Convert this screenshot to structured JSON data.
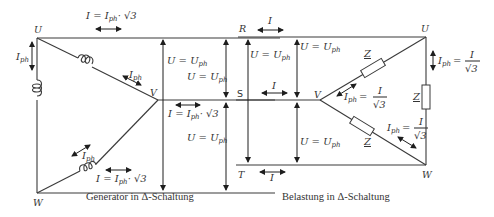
{
  "generator": {
    "caption": "Generator in Δ-Schaltung",
    "nodes": {
      "U": "U",
      "V": "V",
      "W": "W"
    },
    "line_current_top": "I = I",
    "line_current_bottom": "I = I",
    "mid_current": "I = I",
    "ph_sub": "ph",
    "sqrt3": "· √3",
    "phase_current": "I",
    "voltage_upper": "U = U",
    "voltage_upper2": "U = U",
    "voltage_lower": "U = U"
  },
  "load": {
    "caption": "Belastung in Δ-Schaltung",
    "lines": {
      "R": "R",
      "S": "S",
      "T": "T"
    },
    "nodes": {
      "U": "U",
      "V": "V",
      "W": "W"
    },
    "line_current": "I",
    "voltage_label": "U = U",
    "ph_sub": "ph",
    "impedance": "Z",
    "phase_current_lhs": "I",
    "phase_current_eq": "=",
    "phase_current_num": "I",
    "phase_current_den": "√3"
  },
  "colors": {
    "line": "#3a3a3a",
    "text": "#333333",
    "background": "#ffffff"
  }
}
